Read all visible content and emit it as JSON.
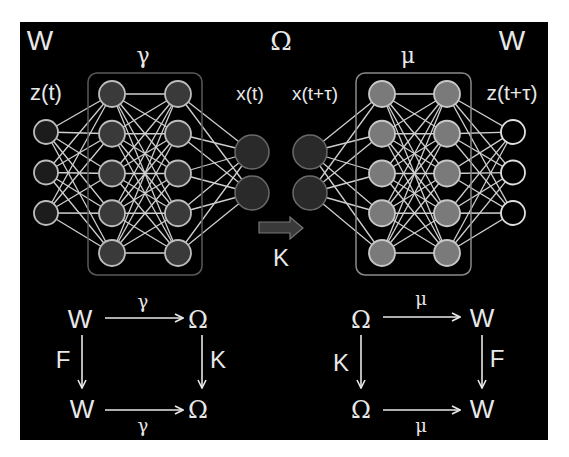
{
  "figure": {
    "background": "#000000",
    "frame": "#ffffff"
  },
  "top_labels": {
    "left_space": "W",
    "latent_space": "Ω",
    "right_space": "W",
    "encoder": "γ",
    "decoder": "μ"
  },
  "network_labels": {
    "input": "z(t)",
    "latent_in": "x(t)",
    "latent_out": "x(t+τ)",
    "output": "z(t+τ)",
    "koopman": "K"
  },
  "encoder_network": {
    "input_nodes": 3,
    "hidden_layers": [
      5,
      5
    ],
    "output_nodes": 2,
    "hidden_fill": "#3a3a3a",
    "hidden_stroke": "#bdbdbd",
    "input_fill": "#1c1c1c",
    "input_stroke": "#bdbdbd"
  },
  "decoder_network": {
    "input_nodes": 2,
    "hidden_layers": [
      5,
      5
    ],
    "output_nodes": 3,
    "hidden_fill": "#7a7a7a",
    "hidden_stroke": "#c8c8c8",
    "output_fill": "#000000",
    "output_stroke": "#e0e0e0"
  },
  "latent_nodes": {
    "fill": "#2a2a2a",
    "stroke": "#6a6a6a"
  },
  "edge_color": "#cfcfcf",
  "commutative_left": {
    "top_left": "W",
    "top_right": "Ω",
    "bottom_left": "W",
    "bottom_right": "Ω",
    "top_arrow": "γ",
    "bottom_arrow": "γ",
    "left_arrow": "F",
    "right_arrow": "K"
  },
  "commutative_right": {
    "top_left": "Ω",
    "top_right": "W",
    "bottom_left": "Ω",
    "bottom_right": "W",
    "top_arrow": "μ",
    "bottom_arrow": "μ",
    "left_arrow": "K",
    "right_arrow": "F"
  }
}
